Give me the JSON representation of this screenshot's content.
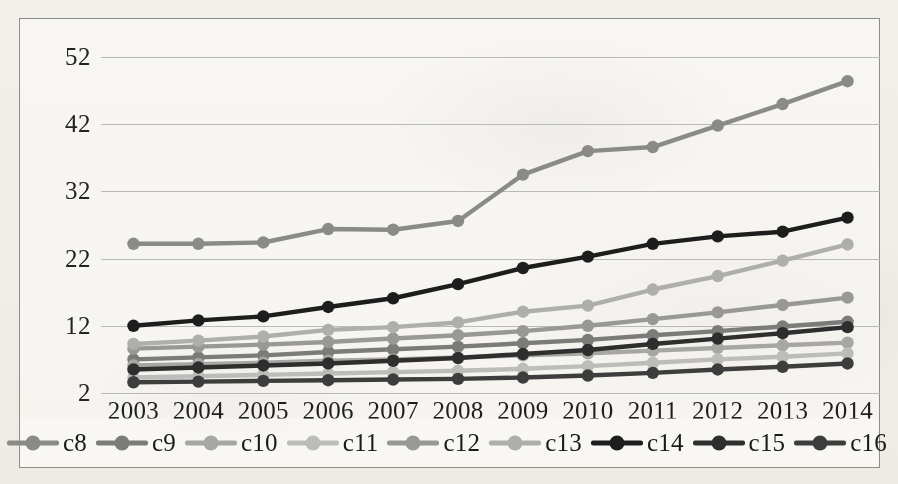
{
  "chart_data": {
    "type": "line",
    "title": "",
    "xlabel": "",
    "ylabel": "",
    "categories": [
      "2003",
      "2004",
      "2005",
      "2006",
      "2007",
      "2008",
      "2009",
      "2010",
      "2011",
      "2012",
      "2013",
      "2014"
    ],
    "ytick_labels": [
      "52",
      "42",
      "32",
      "22",
      "12",
      "2"
    ],
    "ytick_values": [
      52,
      42,
      32,
      22,
      12,
      2
    ],
    "ylim": [
      2,
      52
    ],
    "xlim_categories": 12,
    "grid": "horizontal",
    "legend_position": "bottom",
    "markers": "circle",
    "series": [
      {
        "name": "c8",
        "color": "#8a8a88",
        "values": [
          24.2,
          24.2,
          24.4,
          26.4,
          26.3,
          27.6,
          34.5,
          38.0,
          38.6,
          41.8,
          45.0,
          48.4
        ]
      },
      {
        "name": "c9",
        "color": "#7b7b79",
        "values": [
          7.0,
          7.3,
          7.6,
          8.1,
          8.5,
          8.9,
          9.4,
          9.9,
          10.6,
          11.2,
          11.9,
          12.6
        ]
      },
      {
        "name": "c10",
        "color": "#a6a6a3",
        "values": [
          6.1,
          6.3,
          6.5,
          6.8,
          7.0,
          7.3,
          7.6,
          7.9,
          8.3,
          8.7,
          9.1,
          9.5
        ]
      },
      {
        "name": "c11",
        "color": "#bcbcb9",
        "values": [
          4.3,
          4.5,
          4.7,
          4.9,
          5.1,
          5.3,
          5.6,
          6.0,
          6.5,
          7.0,
          7.4,
          7.9
        ]
      },
      {
        "name": "c12",
        "color": "#989896",
        "values": [
          8.6,
          8.9,
          9.2,
          9.6,
          10.1,
          10.6,
          11.2,
          12.0,
          13.0,
          14.0,
          15.1,
          16.2
        ]
      },
      {
        "name": "c13",
        "color": "#aeaeab",
        "values": [
          9.3,
          9.8,
          10.4,
          11.4,
          11.8,
          12.5,
          14.1,
          15.0,
          17.4,
          19.4,
          21.7,
          24.1
        ]
      },
      {
        "name": "c14",
        "color": "#1d1d1d",
        "values": [
          12.0,
          12.8,
          13.4,
          14.8,
          16.1,
          18.2,
          20.6,
          22.3,
          24.2,
          25.3,
          26.0,
          28.1
        ]
      },
      {
        "name": "c15",
        "color": "#2e2e2e",
        "values": [
          5.5,
          5.8,
          6.1,
          6.4,
          6.8,
          7.2,
          7.8,
          8.4,
          9.3,
          10.1,
          10.9,
          11.8
        ]
      },
      {
        "name": "c16",
        "color": "#3d3d3d",
        "values": [
          3.6,
          3.7,
          3.8,
          3.9,
          4.0,
          4.1,
          4.3,
          4.6,
          5.0,
          5.5,
          5.9,
          6.4
        ]
      }
    ]
  },
  "legend": {
    "items": [
      {
        "label": "c8",
        "color": "#8a8a88"
      },
      {
        "label": "c9",
        "color": "#7b7b79"
      },
      {
        "label": "c10",
        "color": "#a6a6a3"
      },
      {
        "label": "c11",
        "color": "#bcbcb9"
      },
      {
        "label": "c12",
        "color": "#989896"
      },
      {
        "label": "c13",
        "color": "#aeaeab"
      },
      {
        "label": "c14",
        "color": "#1d1d1d"
      },
      {
        "label": "c15",
        "color": "#2e2e2e"
      },
      {
        "label": "c16",
        "color": "#3d3d3d"
      }
    ]
  },
  "style": {
    "background": "#f7f6f3",
    "frame_border": "#8d8d8a",
    "gridline_color": "#b9b9b6",
    "text_color": "#1e1e1e"
  }
}
